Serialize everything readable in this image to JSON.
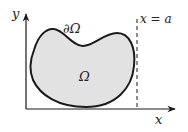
{
  "diagram": {
    "title": "",
    "labels": {
      "y_axis": "y",
      "x_axis": "x",
      "boundary": "∂Ω",
      "region": "Ω",
      "line": "x = a"
    },
    "colors": {
      "region_fill": "#e2e2e2",
      "stroke": "#1a1a1a",
      "background": "#ffffff"
    },
    "elements": [
      {
        "type": "axis",
        "name": "y-axis",
        "direction": "up"
      },
      {
        "type": "axis",
        "name": "x-axis",
        "direction": "right"
      },
      {
        "type": "closed-curve",
        "name": "region-omega",
        "boundary": "∂Ω"
      },
      {
        "type": "dashed-line",
        "name": "vertical-line",
        "equation": "x = a"
      }
    ]
  }
}
